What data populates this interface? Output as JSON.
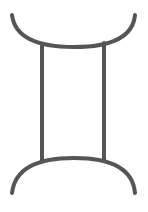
{
  "symbol": {
    "name": "gemini-zodiac-symbol",
    "glyph": "♊",
    "stroke_color": "#555555",
    "background_color": "#ffffff",
    "stroke_width": 4
  }
}
